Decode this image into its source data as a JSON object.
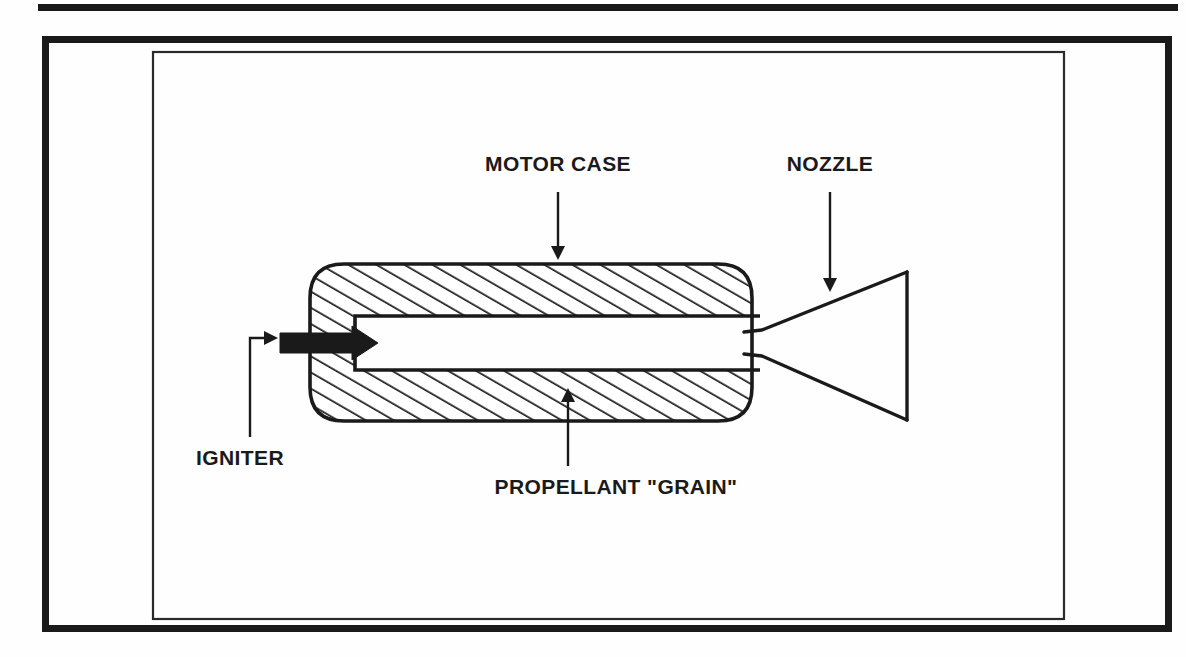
{
  "figure": {
    "background_color": "#fefefe",
    "ink_color": "#1a1a1a",
    "frames": {
      "top_rule": {
        "x": 38,
        "y": 4,
        "width": 1140,
        "height": 7
      },
      "outer_frame": {
        "x": 42,
        "y": 36,
        "width": 1130,
        "height": 596,
        "stroke_width": 7
      },
      "inner_frame": {
        "x": 152,
        "y": 51,
        "width": 913,
        "height": 569,
        "stroke_width": 2
      }
    },
    "labels": [
      {
        "id": "motor-case",
        "text": "MOTOR CASE",
        "text_x": 558,
        "text_y": 171,
        "anchor": "middle",
        "leader": {
          "type": "vertical-arrow-down",
          "x": 558,
          "y1": 192,
          "y2": 258
        }
      },
      {
        "id": "nozzle",
        "text": "NOZZLE",
        "text_x": 830,
        "text_y": 171,
        "anchor": "middle",
        "leader": {
          "type": "vertical-arrow-down",
          "x": 830,
          "y1": 192,
          "y2": 290
        }
      },
      {
        "id": "igniter",
        "text": "IGNITER",
        "text_x": 196,
        "text_y": 465,
        "anchor": "start",
        "leader": {
          "type": "elbow-arrow-right",
          "x": 250,
          "y1": 437,
          "y2": 338,
          "x2": 276
        }
      },
      {
        "id": "propellant-grain",
        "text": "PROPELLANT \"GRAIN\"",
        "text_x": 616,
        "text_y": 494,
        "anchor": "middle",
        "leader": {
          "type": "vertical-arrow-up",
          "x": 568,
          "y1": 466,
          "y2": 390
        }
      }
    ],
    "motor": {
      "grain": {
        "description": "hatched propellant grain, rounded ends, central cylindrical bore",
        "left": 310,
        "right": 752,
        "top": 264,
        "bottom": 421,
        "corner_radius": 34,
        "bore_left": 355,
        "bore_top": 316,
        "bore_bottom": 370,
        "hatch_angle_deg": 60,
        "hatch_spacing": 14
      },
      "igniter_arrow": {
        "description": "solid black igniter jet arrow pointing right",
        "tail_x": 280,
        "tip_x": 378,
        "center_y": 343,
        "shaft_height": 20,
        "head_height": 34,
        "head_length": 26,
        "color": "#1a1a1a"
      },
      "nozzle": {
        "description": "converging-diverging de Laval bell nozzle",
        "throat_x": 762,
        "throat_top": 330,
        "throat_bottom": 356,
        "exit_x": 907,
        "exit_top": 272,
        "exit_bottom": 420,
        "entry_top": 316,
        "entry_bottom": 370
      }
    }
  }
}
